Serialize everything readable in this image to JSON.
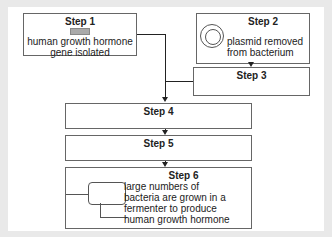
{
  "diagram": {
    "steps": [
      {
        "label": "Step 1",
        "text": "human growth hormone gene isolated"
      },
      {
        "label": "Step 2",
        "text": "plasmid removed from bacterium"
      },
      {
        "label": "Step 3",
        "text": ""
      },
      {
        "label": "Step 4",
        "text": ""
      },
      {
        "label": "Step 5",
        "text": ""
      },
      {
        "label": "Step 6",
        "text_lines": [
          "large numbers of",
          "bacteria are grown in a",
          "fermenter to produce",
          "human growth hormone"
        ]
      }
    ],
    "step1_lines": [
      "human growth hormone",
      "gene isolated"
    ],
    "step2_lines": [
      "plasmid removed",
      "from bacterium"
    ]
  }
}
